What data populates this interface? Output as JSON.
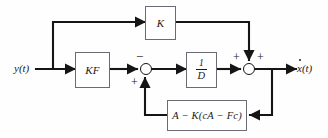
{
  "diagram": {
    "background_color": "#fefefe",
    "line_color": "#151515",
    "block_border_color": "#6b6b73",
    "signals": {
      "input_label": "y(t)",
      "output_label_base": "x(t)",
      "output_label_full": "ẋ(t)"
    },
    "blocks": [
      {
        "id": "k",
        "label": "K"
      },
      {
        "id": "kf",
        "label": "KF"
      },
      {
        "id": "invd",
        "numerator": "1",
        "denominator": "D",
        "label": "1/D"
      },
      {
        "id": "fb",
        "label": "A − K(cA − Fc)"
      }
    ],
    "summing_junctions": [
      {
        "id": "sum-1",
        "signs": {
          "top": "−",
          "bottom_left": "+"
        }
      },
      {
        "id": "sum-2",
        "signs": {
          "left": "+",
          "right": "+"
        }
      }
    ],
    "signs": {
      "minus": "−",
      "plus": "+"
    }
  }
}
